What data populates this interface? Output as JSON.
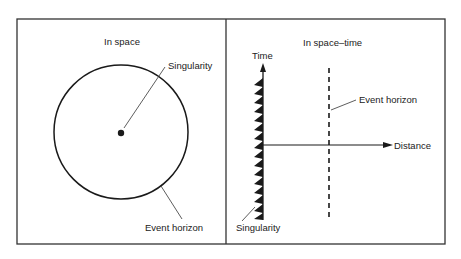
{
  "diagram": {
    "left_panel": {
      "title": "In space",
      "labels": {
        "singularity": "Singularity",
        "event_horizon": "Event horizon"
      }
    },
    "right_panel": {
      "title": "In space–time",
      "axes": {
        "y": "Time",
        "x": "Distance"
      },
      "labels": {
        "event_horizon": "Event horizon",
        "singularity": "Singularity"
      }
    },
    "colors": {
      "ink": "#1a1a1a",
      "frame": "#333333",
      "background": "#ffffff"
    }
  }
}
